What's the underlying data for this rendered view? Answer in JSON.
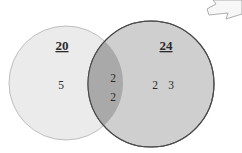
{
  "diagram": {
    "type": "venn",
    "sets": [
      {
        "id": "left",
        "total_label": "20",
        "only_elements": [
          "5"
        ],
        "fill": "#ebebeb",
        "stroke": "#b8b8b8"
      },
      {
        "id": "right",
        "total_label": "24",
        "only_elements": [
          "2",
          "3"
        ],
        "fill": "#cfcfcf",
        "stroke": "#4a4a4a"
      }
    ],
    "intersection": {
      "elements": [
        "2",
        "2"
      ],
      "fill": "#a9a9a9"
    },
    "arrow_icon": {
      "name": "arrow-right-outline-icon",
      "fill": "#f7f7f7",
      "stroke": "#9a9a9a"
    }
  }
}
